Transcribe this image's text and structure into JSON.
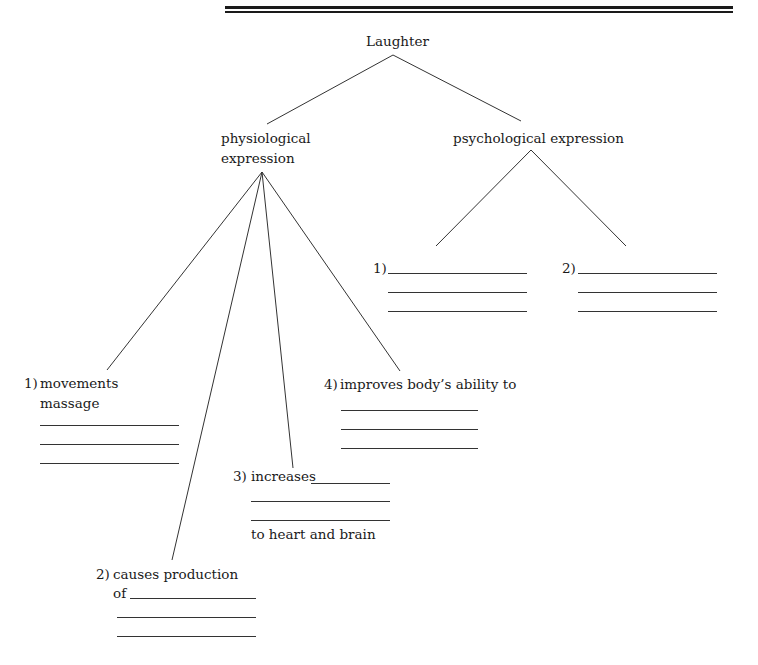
{
  "diagram": {
    "root": "Laughter",
    "branches": [
      {
        "label_line1": "physiological",
        "label_line2": "expression",
        "items": [
          {
            "num": "1)",
            "line1": "movements",
            "line2": "massage",
            "blanks": 3
          },
          {
            "num": "2)",
            "line1": "causes production",
            "line2": "of",
            "blanks": 3
          },
          {
            "num": "3)",
            "line1": "increases",
            "line2": "to heart and brain",
            "blanks": 3
          },
          {
            "num": "4)",
            "line1": "improves body’s ability to",
            "blanks": 3
          }
        ]
      },
      {
        "label": "psychological expression",
        "items": [
          {
            "num": "1)",
            "blanks": 3
          },
          {
            "num": "2)",
            "blanks": 3
          }
        ]
      }
    ]
  }
}
